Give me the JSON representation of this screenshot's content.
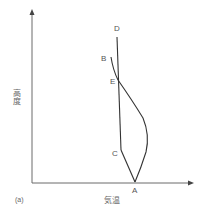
{
  "diagram": {
    "panel_label": "(a)",
    "x_axis_label": "気温",
    "y_axis_label": "高度",
    "colors": {
      "axis": "#6b6b6b",
      "line": "#333333",
      "text": "#555555"
    },
    "points": [
      {
        "id": "A",
        "label": "A"
      },
      {
        "id": "B",
        "label": "B"
      },
      {
        "id": "C",
        "label": "C"
      },
      {
        "id": "D",
        "label": "D"
      },
      {
        "id": "E",
        "label": "E"
      }
    ],
    "lines": [
      {
        "id": "D-C",
        "description": "near-vertical line from D down through E to C"
      },
      {
        "id": "C-A",
        "description": "straight line from C to A"
      },
      {
        "id": "B-E-A",
        "description": "curve from B through E bulging right to A"
      }
    ]
  }
}
